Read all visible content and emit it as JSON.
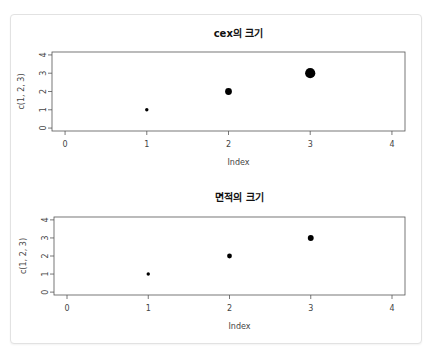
{
  "chart_data": [
    {
      "type": "scatter",
      "title": "cex의 크기",
      "xlabel": "Index",
      "ylabel": "c(1, 2, 3)",
      "x": [
        1,
        2,
        3
      ],
      "y": [
        1,
        2,
        3
      ],
      "point_sizes_cex": [
        1,
        2,
        3
      ],
      "xlim": [
        0,
        4
      ],
      "ylim": [
        0,
        4
      ],
      "x_ticks": [
        "0",
        "1",
        "2",
        "3",
        "4"
      ],
      "y_ticks": [
        "0",
        "1",
        "2",
        "3",
        "4"
      ],
      "grid": false,
      "legend": null
    },
    {
      "type": "scatter",
      "title": "면적의 크기",
      "xlabel": "Index",
      "ylabel": "c(1, 2, 3)",
      "x": [
        1,
        2,
        3
      ],
      "y": [
        1,
        2,
        3
      ],
      "point_sizes_cex": [
        1,
        1.414,
        1.732
      ],
      "xlim": [
        0,
        4
      ],
      "ylim": [
        0,
        4
      ],
      "x_ticks": [
        "0",
        "1",
        "2",
        "3",
        "4"
      ],
      "y_ticks": [
        "0",
        "1",
        "2",
        "3",
        "4"
      ],
      "grid": false,
      "legend": null
    }
  ],
  "point_color": "#000000",
  "frame_color": "#555555"
}
